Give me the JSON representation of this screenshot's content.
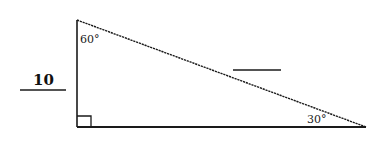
{
  "diagram": {
    "type": "right-triangle",
    "vertices": {
      "top": {
        "x": 77,
        "y": 20
      },
      "right_angle": {
        "x": 77,
        "y": 127
      },
      "right": {
        "x": 366,
        "y": 127
      }
    },
    "angles": {
      "top": "60°",
      "right": "30°",
      "bottom_left": "90° (right angle marker)"
    },
    "labels": {
      "vertical_leg_value": "10",
      "angle_top": "60°",
      "angle_right": "30°"
    },
    "blanks": {
      "hypotenuse_answer": "",
      "horizontal_leg_answer": ""
    },
    "colors": {
      "stroke": "#1a1a1a",
      "background": "#ffffff"
    }
  }
}
